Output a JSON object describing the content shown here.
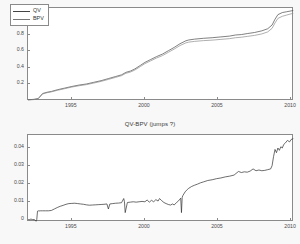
{
  "figure": {
    "background": "#f8f8f8",
    "plot_background": "#ffffff",
    "axis_color": "#8a8a8a"
  },
  "chart_data": [
    {
      "id": "top",
      "type": "line",
      "title": "",
      "xlabel": "",
      "ylabel": "",
      "xlim": [
        1992.0,
        2010.2
      ],
      "ylim": [
        0.0,
        1.12
      ],
      "xticks": [
        1995,
        2000,
        2005,
        2010
      ],
      "xticklabels": [
        "1995",
        "2000",
        "2005",
        "2010"
      ],
      "yticks": [
        0.2,
        0.4,
        0.6,
        0.8,
        1
      ],
      "yticklabels": [
        "0.2",
        "0.4",
        "0.6",
        "0.8",
        "1"
      ],
      "grid": false,
      "legend_position": "upper left",
      "legend": [
        "QV",
        "BPV"
      ],
      "series": [
        {
          "name": "QV",
          "color": "#4a4a4a",
          "x": [
            1992.0,
            1992.4,
            1992.7,
            1993.0,
            1993.3,
            1993.6,
            1994.0,
            1994.5,
            1995.0,
            1995.5,
            1996.0,
            1996.5,
            1997.0,
            1997.5,
            1998.0,
            1998.4,
            1998.7,
            1999.0,
            1999.3,
            1999.7,
            2000.0,
            2000.4,
            2000.8,
            2001.2,
            2001.6,
            2002.0,
            2002.4,
            2002.8,
            2003.0,
            2003.4,
            2004.0,
            2004.6,
            2005.2,
            2005.8,
            2006.2,
            2006.6,
            2007.0,
            2007.5,
            2008.0,
            2008.4,
            2008.7,
            2008.9,
            2009.1,
            2009.4,
            2009.7,
            2010.0,
            2010.15
          ],
          "values": [
            0.015,
            0.02,
            0.03,
            0.09,
            0.105,
            0.115,
            0.135,
            0.155,
            0.175,
            0.192,
            0.205,
            0.225,
            0.245,
            0.27,
            0.295,
            0.315,
            0.345,
            0.36,
            0.385,
            0.43,
            0.465,
            0.5,
            0.535,
            0.565,
            0.605,
            0.645,
            0.69,
            0.725,
            0.735,
            0.745,
            0.755,
            0.762,
            0.772,
            0.782,
            0.795,
            0.8,
            0.812,
            0.825,
            0.845,
            0.87,
            0.915,
            0.985,
            1.04,
            1.065,
            1.075,
            1.085,
            1.09
          ]
        },
        {
          "name": "BPV",
          "color": "#8d8d8d",
          "x": [
            1992.0,
            1992.4,
            1992.7,
            1993.0,
            1993.3,
            1993.6,
            1994.0,
            1994.5,
            1995.0,
            1995.5,
            1996.0,
            1996.5,
            1997.0,
            1997.5,
            1998.0,
            1998.4,
            1998.7,
            1999.0,
            1999.3,
            1999.7,
            2000.0,
            2000.4,
            2000.8,
            2001.2,
            2001.6,
            2002.0,
            2002.4,
            2002.8,
            2003.0,
            2003.4,
            2004.0,
            2004.6,
            2005.2,
            2005.8,
            2006.2,
            2006.6,
            2007.0,
            2007.5,
            2008.0,
            2008.4,
            2008.7,
            2008.9,
            2009.1,
            2009.4,
            2009.7,
            2010.0,
            2010.15
          ],
          "values": [
            0.012,
            0.017,
            0.026,
            0.085,
            0.1,
            0.11,
            0.128,
            0.148,
            0.168,
            0.184,
            0.197,
            0.216,
            0.236,
            0.26,
            0.285,
            0.305,
            0.334,
            0.348,
            0.372,
            0.416,
            0.45,
            0.484,
            0.518,
            0.547,
            0.586,
            0.625,
            0.668,
            0.7,
            0.709,
            0.718,
            0.727,
            0.733,
            0.742,
            0.751,
            0.762,
            0.768,
            0.778,
            0.79,
            0.808,
            0.832,
            0.875,
            0.94,
            0.995,
            1.02,
            1.035,
            1.05,
            1.055
          ]
        }
      ]
    },
    {
      "id": "bottom",
      "type": "line",
      "title": "QV-BPV (jumps ?)",
      "xlabel": "",
      "ylabel": "",
      "xlim": [
        1992.0,
        2010.2
      ],
      "ylim": [
        -0.0012,
        0.047
      ],
      "xticks": [
        1995,
        2000,
        2005,
        2010
      ],
      "xticklabels": [
        "1995",
        "2000",
        "2005",
        "2010"
      ],
      "yticks": [
        0,
        0.01,
        0.02,
        0.03,
        0.04
      ],
      "yticklabels": [
        "0",
        "0.01",
        "0.02",
        "0.03",
        "0.04"
      ],
      "grid": false,
      "series": [
        {
          "name": "QV-BPV",
          "color": "#2f2f2f",
          "x": [
            1992.0,
            1992.1,
            1992.2,
            1992.3,
            1992.45,
            1992.55,
            1992.6,
            1992.65,
            1992.7,
            1992.75,
            1992.85,
            1993.0,
            1993.2,
            1993.4,
            1993.6,
            1993.8,
            1994.0,
            1994.2,
            1994.4,
            1994.6,
            1994.8,
            1995.0,
            1995.2,
            1995.4,
            1995.6,
            1995.8,
            1996.0,
            1996.2,
            1996.4,
            1996.6,
            1996.8,
            1997.0,
            1997.2,
            1997.4,
            1997.5,
            1997.6,
            1997.8,
            1998.0,
            1998.2,
            1998.4,
            1998.55,
            1998.6,
            1998.65,
            1998.8,
            1999.0,
            1999.2,
            1999.4,
            1999.6,
            1999.8,
            2000.0,
            2000.15,
            2000.3,
            2000.45,
            2000.6,
            2000.75,
            2000.9,
            2001.0,
            2001.15,
            2001.3,
            2001.45,
            2001.6,
            2001.75,
            2001.9,
            2002.0,
            2002.15,
            2002.3,
            2002.45,
            2002.5,
            2002.55,
            2002.6,
            2002.75,
            2002.9,
            2003.0,
            2003.2,
            2003.4,
            2003.6,
            2003.8,
            2004.0,
            2004.3,
            2004.6,
            2004.9,
            2005.2,
            2005.5,
            2005.8,
            2006.1,
            2006.4,
            2006.6,
            2006.8,
            2007.0,
            2007.2,
            2007.4,
            2007.6,
            2007.8,
            2008.0,
            2008.2,
            2008.4,
            2008.6,
            2008.7,
            2008.8,
            2008.9,
            2009.0,
            2009.1,
            2009.2,
            2009.3,
            2009.4,
            2009.5,
            2009.6,
            2009.75,
            2009.9,
            2010.0,
            2010.15
          ],
          "values": [
            0.0002,
            0.0001,
            0.0004,
            0.0002,
            0.0001,
            -0.0008,
            0.0002,
            0.0048,
            0.005,
            0.0049,
            0.005,
            0.005,
            0.005,
            0.005,
            0.0052,
            0.006,
            0.0068,
            0.0075,
            0.008,
            0.0086,
            0.009,
            0.0091,
            0.0092,
            0.009,
            0.0088,
            0.0086,
            0.0083,
            0.0081,
            0.0082,
            0.0083,
            0.0084,
            0.0085,
            0.0086,
            0.0088,
            0.006,
            0.0088,
            0.009,
            0.0092,
            0.0093,
            0.0095,
            0.0118,
            0.01,
            0.004,
            0.0096,
            0.0098,
            0.01,
            0.0098,
            0.01,
            0.0102,
            0.01,
            0.011,
            0.0098,
            0.0108,
            0.01,
            0.0112,
            0.0104,
            0.0118,
            0.0106,
            0.0096,
            0.009,
            0.0085,
            0.0082,
            0.0088,
            0.0082,
            0.0095,
            0.0105,
            0.012,
            0.004,
            0.0125,
            0.0135,
            0.0155,
            0.0168,
            0.0175,
            0.0185,
            0.0192,
            0.0198,
            0.0205,
            0.021,
            0.0218,
            0.0222,
            0.0228,
            0.0232,
            0.0238,
            0.0242,
            0.0248,
            0.0268,
            0.0262,
            0.0266,
            0.0264,
            0.027,
            0.0282,
            0.0272,
            0.0276,
            0.0272,
            0.0274,
            0.0278,
            0.0282,
            0.03,
            0.035,
            0.039,
            0.0372,
            0.0398,
            0.0385,
            0.0405,
            0.0398,
            0.0418,
            0.0425,
            0.044,
            0.0432,
            0.0445,
            0.045,
            0.0452
          ]
        }
      ]
    }
  ]
}
